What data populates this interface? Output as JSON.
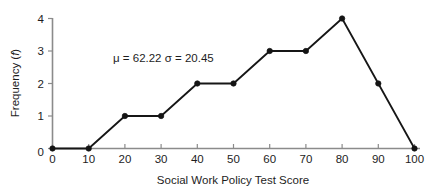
{
  "chart_data": {
    "type": "line",
    "title": "",
    "subtitle": "",
    "xlabel": "Social Work Policy Test Score",
    "ylabel_prefix": "Frequency (",
    "ylabel_italic": "f",
    "ylabel_suffix": ")",
    "ylabel_full": "Frequency (f)",
    "x": [
      0,
      10,
      20,
      30,
      40,
      50,
      60,
      70,
      80,
      90,
      100
    ],
    "values": [
      0,
      0,
      1,
      1,
      2,
      2,
      3,
      3,
      4,
      2,
      0
    ],
    "series": [
      {
        "name": "Frequency",
        "values": [
          0,
          0,
          1,
          1,
          2,
          2,
          3,
          3,
          4,
          2,
          0
        ]
      }
    ],
    "xticks": [
      "0",
      "10",
      "20",
      "30",
      "40",
      "50",
      "60",
      "70",
      "80",
      "90",
      "100"
    ],
    "yticks": [
      "0",
      "1",
      "2",
      "3",
      "4"
    ],
    "xlim": [
      0,
      100
    ],
    "ylim": [
      0,
      4
    ],
    "grid": false,
    "legend": false,
    "legend_position": "none",
    "marker": "circle",
    "line_color": "#161616",
    "marker_color": "#141414",
    "axis_color": "#8b8b8b",
    "background_color": "#ffffff",
    "annotations": [
      {
        "name": "mean-sigma-annotation",
        "text": "μ = 62.22   σ = 20.45",
        "mu_label": "μ = 62.22",
        "sigma_label": "σ = 20.45",
        "x_px": 113,
        "y_px": 62
      }
    ]
  }
}
